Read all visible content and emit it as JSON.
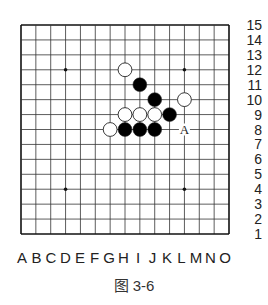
{
  "diagram": {
    "type": "go-board",
    "size": 15,
    "columns": [
      "A",
      "B",
      "C",
      "D",
      "E",
      "F",
      "G",
      "H",
      "I",
      "J",
      "K",
      "L",
      "M",
      "N",
      "O"
    ],
    "rows": [
      "15",
      "14",
      "13",
      "12",
      "11",
      "10",
      "9",
      "8",
      "7",
      "6",
      "5",
      "4",
      "3",
      "2",
      "1"
    ],
    "star_points": [
      "D12",
      "L12",
      "D4",
      "L4"
    ],
    "stones": [
      {
        "pos": "H12",
        "color": "white"
      },
      {
        "pos": "I11",
        "color": "black"
      },
      {
        "pos": "J10",
        "color": "black"
      },
      {
        "pos": "L10",
        "color": "white"
      },
      {
        "pos": "H9",
        "color": "white"
      },
      {
        "pos": "I9",
        "color": "white"
      },
      {
        "pos": "J9",
        "color": "white"
      },
      {
        "pos": "K9",
        "color": "black"
      },
      {
        "pos": "G8",
        "color": "white"
      },
      {
        "pos": "H8",
        "color": "black"
      },
      {
        "pos": "I8",
        "color": "black"
      },
      {
        "pos": "J8",
        "color": "black"
      }
    ],
    "markers": [
      {
        "pos": "L8",
        "label": "A"
      }
    ],
    "caption": "图 3-6",
    "colors": {
      "grid": "#333333",
      "border": "#111111",
      "black_stone": "#000000",
      "white_stone": "#ffffff",
      "stone_outline": "#222222"
    }
  }
}
